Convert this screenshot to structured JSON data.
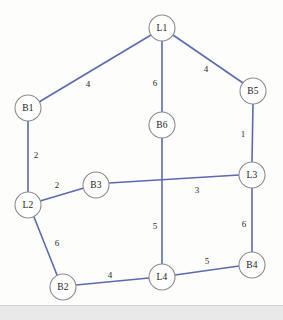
{
  "diagram": {
    "canvas": {
      "width": 283,
      "height": 320
    },
    "colors": {
      "edge": "#5b6bb0",
      "node_stroke": "#8c8c8c",
      "node_fill": "#ffffff",
      "label_text": "#1b1b1b",
      "background": "#fdfdfb",
      "bottom_band": "#e9e9e9"
    },
    "nodes": [
      {
        "id": "L1",
        "label": "L1",
        "x": 162,
        "y": 28,
        "r": 13
      },
      {
        "id": "B5",
        "label": "B5",
        "x": 253,
        "y": 91,
        "r": 13
      },
      {
        "id": "B1",
        "label": "B1",
        "x": 28,
        "y": 108,
        "r": 13
      },
      {
        "id": "B6",
        "label": "B6",
        "x": 162,
        "y": 125,
        "r": 13
      },
      {
        "id": "L3",
        "label": "L3",
        "x": 252,
        "y": 175,
        "r": 13
      },
      {
        "id": "B3",
        "label": "B3",
        "x": 96,
        "y": 185,
        "r": 13
      },
      {
        "id": "L2",
        "label": "L2",
        "x": 28,
        "y": 205,
        "r": 13
      },
      {
        "id": "B4",
        "label": "B4",
        "x": 252,
        "y": 265,
        "r": 13
      },
      {
        "id": "L4",
        "label": "L4",
        "x": 162,
        "y": 277,
        "r": 13
      },
      {
        "id": "B2",
        "label": "B2",
        "x": 63,
        "y": 287,
        "r": 13
      }
    ],
    "edges": [
      {
        "from": "B1",
        "to": "L1",
        "weight": "4",
        "lx": 88,
        "ly": 84
      },
      {
        "from": "L1",
        "to": "B6",
        "weight": "6",
        "lx": 155,
        "ly": 83
      },
      {
        "from": "L1",
        "to": "B5",
        "weight": "4",
        "lx": 206,
        "ly": 69
      },
      {
        "from": "B5",
        "to": "L3",
        "weight": "1",
        "lx": 243,
        "ly": 134
      },
      {
        "from": "B1",
        "to": "L2",
        "weight": "2",
        "lx": 36,
        "ly": 155
      },
      {
        "from": "L2",
        "to": "B3",
        "weight": "2",
        "lx": 57,
        "ly": 185
      },
      {
        "from": "B3",
        "to": "L3",
        "weight": "3",
        "lx": 197,
        "ly": 190
      },
      {
        "from": "B6",
        "to": "L4",
        "weight": "5",
        "lx": 155,
        "ly": 226
      },
      {
        "from": "L3",
        "to": "B4",
        "weight": "6",
        "lx": 244,
        "ly": 224
      },
      {
        "from": "L2",
        "to": "B2",
        "weight": "6",
        "lx": 57,
        "ly": 243
      },
      {
        "from": "B2",
        "to": "L4",
        "weight": "4",
        "lx": 110,
        "ly": 275
      },
      {
        "from": "L4",
        "to": "B4",
        "weight": "5",
        "lx": 207,
        "ly": 261
      }
    ]
  }
}
